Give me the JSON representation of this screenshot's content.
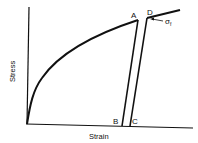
{
  "diagram": {
    "xlabel": "Strain",
    "ylabel": "Stress",
    "points": {
      "A": "A",
      "B": "B",
      "C": "C",
      "D": "D"
    },
    "annotation": "σ",
    "annotation_sub": "f",
    "colors": {
      "line": "#111111",
      "background": "#ffffff"
    }
  }
}
